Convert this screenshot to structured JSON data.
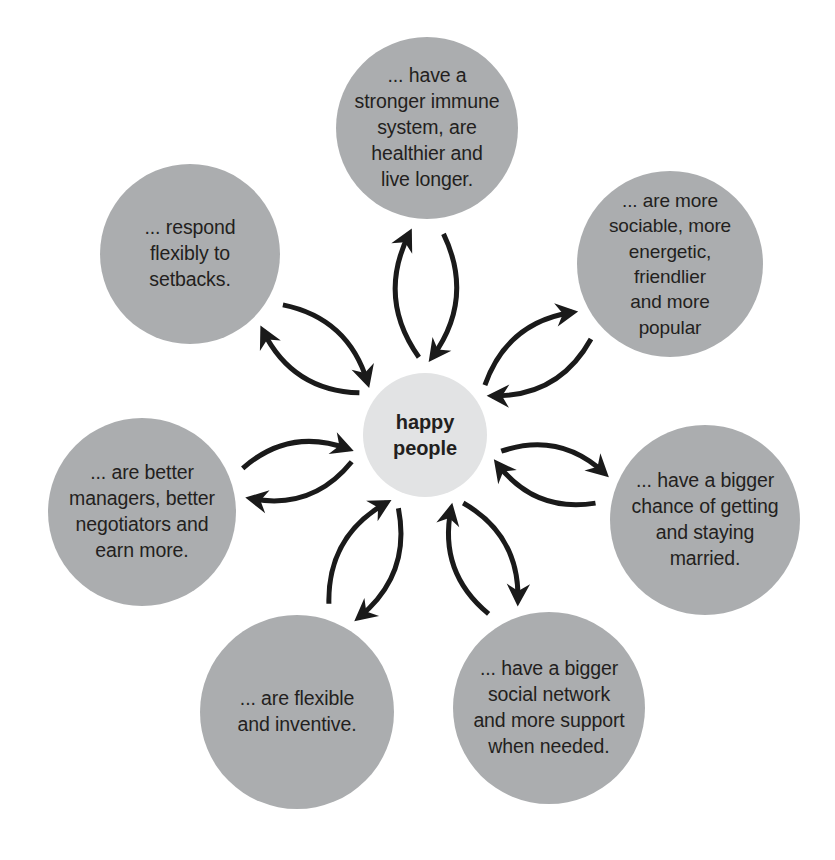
{
  "diagram": {
    "type": "radial-hub-and-spoke",
    "title_text": "happy people",
    "center": {
      "id": "center-happy-people",
      "label": "happy\npeople",
      "cx": 425,
      "cy": 435,
      "r": 62,
      "fill": "#e2e3e4"
    },
    "palette": {
      "outer_fill": "#abadaf",
      "center_fill": "#e2e3e4",
      "text": "#231f20",
      "arrow": "#1a1a1a",
      "background": "#ffffff"
    },
    "nodes": [
      {
        "id": "node-health",
        "name": "immune-system",
        "label": "... have a\nstronger immune\nsystem, are\nhealthier and\nlive longer.",
        "cx": 427,
        "cy": 128,
        "r": 91,
        "angle_deg": -90,
        "font_size": 19.5
      },
      {
        "id": "node-sociable",
        "name": "sociable",
        "label": "... are more\nsociable, more\nenergetic, friendlier\nand more\npopular",
        "cx": 670,
        "cy": 264,
        "r": 93,
        "angle_deg": -38,
        "font_size": 19
      },
      {
        "id": "node-married",
        "name": "marriage",
        "label": "... have a bigger\nchance of getting\nand staying\nmarried.",
        "cx": 705,
        "cy": 520,
        "r": 95,
        "angle_deg": 14,
        "font_size": 19.5
      },
      {
        "id": "node-network",
        "name": "social-network",
        "label": "... have a bigger\nsocial network\nand more support\nwhen needed.",
        "cx": 549,
        "cy": 708,
        "r": 96,
        "angle_deg": 66,
        "font_size": 19.5
      },
      {
        "id": "node-flexible",
        "name": "flexible-inventive",
        "label": "... are flexible\nand inventive.",
        "cx": 297,
        "cy": 712,
        "r": 97,
        "angle_deg": 118,
        "font_size": 19.5
      },
      {
        "id": "node-managers",
        "name": "managers-earnings",
        "label": "... are better\nmanagers, better\nnegotiators and\nearn more.",
        "cx": 142,
        "cy": 512,
        "r": 94,
        "angle_deg": 170,
        "font_size": 19.5
      },
      {
        "id": "node-setbacks",
        "name": "respond-to-setbacks",
        "label": "... respond\nflexibly to\nsetbacks.",
        "cx": 190,
        "cy": 254,
        "r": 90,
        "angle_deg": -138,
        "font_size": 19.5
      }
    ],
    "connectors": {
      "description": "Each spoke is drawn as a pair of curved arrows: one pointing outward from the hub toward the node, one pointing inward from the node back toward the hub.",
      "count_pairs": 7,
      "arrow_head_style": "solid-chevron",
      "stroke_width": 5
    }
  }
}
